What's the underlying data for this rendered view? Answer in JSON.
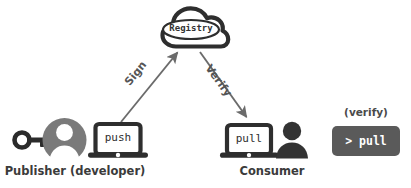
{
  "diagram": {
    "background_color": "#ffffff",
    "nodes": {
      "registry": {
        "icon": "cloud-icon",
        "label": "Registry",
        "stroke_color": "#2e2e2e",
        "fill_color": "#ffffff"
      },
      "publisher": {
        "caption": "Publisher (developer)",
        "key_icon": "key-icon",
        "avatar_icon": "user-avatar-icon",
        "avatar_color": "#7a7a7a",
        "laptop_icon": "laptop-icon",
        "laptop_screen_text": "push",
        "laptop_color": "#2e2e2e"
      },
      "consumer": {
        "caption": "Consumer",
        "laptop_icon": "laptop-icon",
        "laptop_screen_text": "pull",
        "person_icon": "person-icon",
        "person_color": "#333333",
        "laptop_color": "#2e2e2e"
      },
      "terminal": {
        "note": "(verify)",
        "command": "> pull",
        "box_color": "#5a5a5a",
        "text_color": "#ffffff"
      }
    },
    "edges": [
      {
        "name": "sign-arrow",
        "label": "Sign",
        "from": "publisher",
        "to": "registry",
        "color": "#6b6b6b",
        "direction": "up-right"
      },
      {
        "name": "verify-arrow",
        "label": "Verify",
        "from": "registry",
        "to": "consumer",
        "color": "#6b6b6b",
        "direction": "down-right"
      }
    ]
  }
}
